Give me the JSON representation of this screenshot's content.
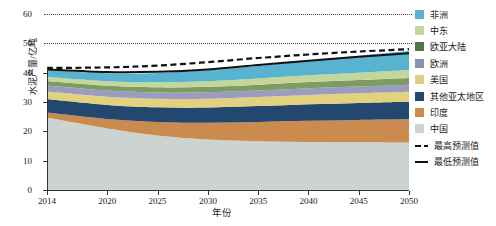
{
  "chart_data": {
    "type": "area",
    "title": "",
    "xlabel": "年份",
    "ylabel": "水泥产量/亿吨",
    "xlim": [
      2014,
      2050
    ],
    "ylim": [
      0,
      60
    ],
    "xticks": [
      2014,
      2020,
      2025,
      2030,
      2035,
      2040,
      2045,
      2050
    ],
    "yticks": [
      0,
      10,
      20,
      30,
      40,
      50,
      60
    ],
    "grid": "dotted-horizontal-above-40",
    "legend_position": "right",
    "stacked": true,
    "x": [
      2014,
      2020,
      2025,
      2030,
      2035,
      2040,
      2045,
      2050
    ],
    "series": [
      {
        "name": "中国",
        "color": "#ccd3d1",
        "values": [
          24.7,
          21.0,
          18.6,
          17.2,
          16.6,
          16.4,
          16.3,
          16.2
        ]
      },
      {
        "name": "印度",
        "color": "#cc8b4e",
        "values": [
          1.7,
          3.2,
          4.6,
          5.7,
          6.6,
          7.2,
          7.6,
          7.9
        ]
      },
      {
        "name": "其他亚太地区",
        "color": "#23476f",
        "values": [
          4.6,
          4.8,
          5.0,
          5.2,
          5.4,
          5.6,
          5.8,
          6.0
        ]
      },
      {
        "name": "美国",
        "color": "#e2d27e",
        "values": [
          2.6,
          2.8,
          2.9,
          3.0,
          3.1,
          3.2,
          3.3,
          3.4
        ]
      },
      {
        "name": "欧洲",
        "color": "#9a9dc0",
        "values": [
          2.0,
          2.1,
          2.1,
          2.2,
          2.2,
          2.3,
          2.3,
          2.4
        ]
      },
      {
        "name": "欧亚大陆",
        "color": "#7e9b63",
        "values": [
          1.6,
          1.7,
          1.8,
          1.9,
          2.0,
          2.1,
          2.2,
          2.3
        ]
      },
      {
        "name": "中东",
        "color": "#c3d79a",
        "values": [
          1.3,
          1.5,
          1.7,
          1.9,
          2.1,
          2.3,
          2.5,
          2.7
        ]
      },
      {
        "name": "非洲",
        "color": "#57b3cf",
        "values": [
          2.3,
          2.7,
          3.2,
          3.7,
          4.3,
          5.0,
          5.8,
          6.6
        ]
      }
    ],
    "lines": [
      {
        "name": "最高预测值",
        "style": "dashed",
        "color": "#111111",
        "values": [
          41.6,
          41.8,
          42.4,
          43.6,
          45.0,
          46.2,
          47.2,
          48.0
        ]
      },
      {
        "name": "最低预测值",
        "style": "solid",
        "color": "#111111",
        "values": [
          41.1,
          40.2,
          40.3,
          41.1,
          42.6,
          44.1,
          45.4,
          46.6
        ]
      }
    ]
  },
  "legend": {
    "areas": [
      {
        "label": "非洲",
        "color": "#57b3cf"
      },
      {
        "label": "中东",
        "color": "#c3d79a"
      },
      {
        "label": "欧亚大陆",
        "color": "#4e7a4a"
      },
      {
        "label": "欧洲",
        "color": "#8d90b4"
      },
      {
        "label": "美国",
        "color": "#ddcd86"
      },
      {
        "label": "其他亚太地区",
        "color": "#23476f"
      },
      {
        "label": "印度",
        "color": "#cc8b4e"
      },
      {
        "label": "中国",
        "color": "#ccd3d1"
      }
    ],
    "lines": [
      {
        "label": "最高预测值",
        "style": "dashed"
      },
      {
        "label": "最低预测值",
        "style": "solid"
      }
    ]
  },
  "axes": {
    "y_label": "水泥产量/亿吨",
    "x_label": "年份",
    "y_ticks": [
      "0",
      "10",
      "20",
      "30",
      "40",
      "50",
      "60"
    ],
    "x_ticks": [
      "2014",
      "2020",
      "2025",
      "2030",
      "2035",
      "2040",
      "2045",
      "2050"
    ]
  }
}
